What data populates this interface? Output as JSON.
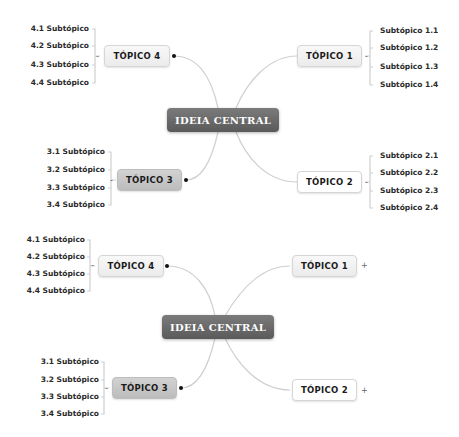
{
  "diagrams": [
    {
      "central": "IDEIA CENTRAL",
      "topics": [
        {
          "label": "TÓPICO 1",
          "subtopics": [
            "Subtópico 1.1",
            "Subtópico 1.2",
            "Subtópico 1.3",
            "Subtópico 1.4"
          ],
          "toggle": "-"
        },
        {
          "label": "TÓPICO 2",
          "subtopics": [
            "Subtópico 2.1",
            "Subtópico 2.2",
            "Subtópico 2.3",
            "Subtópico 2.4"
          ],
          "toggle": "-"
        },
        {
          "label": "TÓPICO 3",
          "subtopics": [
            "3.1 Subtópico",
            "3.2 Subtópico",
            "3.3 Subtópico",
            "3.4 Subtópico"
          ],
          "toggle": "-"
        },
        {
          "label": "TÓPICO 4",
          "subtopics": [
            "4.1 Subtópico",
            "4.2 Subtópico",
            "4.3 Subtópico",
            "4.4 Subtópico"
          ],
          "toggle": "-"
        }
      ]
    },
    {
      "central": "IDEIA CENTRAL",
      "topics": [
        {
          "label": "TÓPICO 1",
          "subtopics": [],
          "toggle": "+"
        },
        {
          "label": "TÓPICO 2",
          "subtopics": [],
          "toggle": "+"
        },
        {
          "label": "TÓPICO 3",
          "subtopics": [
            "3.1 Subtópico",
            "3.2 Subtópico",
            "3.3 Subtópico",
            "3.4 Subtópico"
          ],
          "toggle": "-"
        },
        {
          "label": "TÓPICO 4",
          "subtopics": [
            "4.1 Subtópico",
            "4.2 Subtópico",
            "4.3 Subtópico",
            "4.4 Subtópico"
          ],
          "toggle": "-"
        }
      ]
    }
  ],
  "colors": {
    "central_bg": "#666666",
    "topic3_bg": "#c8c8c8",
    "connector": "#c8c8c8"
  }
}
